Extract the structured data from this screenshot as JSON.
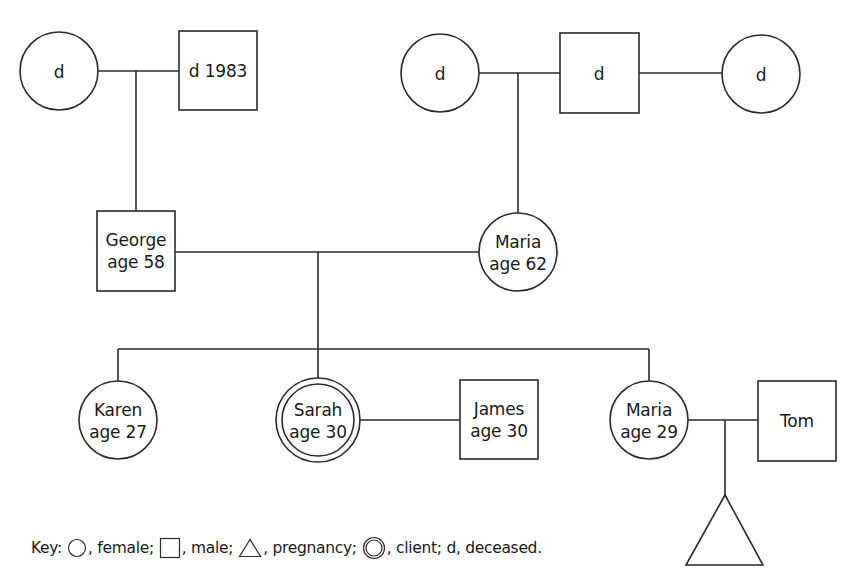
{
  "diagram": {
    "type": "genogram",
    "people": {
      "pgm": {
        "label_line1": "d",
        "label_line2": "",
        "sex": "female",
        "deceased": true
      },
      "pgf": {
        "label_line1": "d 1983",
        "label_line2": "",
        "sex": "male",
        "deceased": true
      },
      "mgm1": {
        "label_line1": "d",
        "label_line2": "",
        "sex": "female",
        "deceased": true
      },
      "mgf": {
        "label_line1": "d",
        "label_line2": "",
        "sex": "male",
        "deceased": true
      },
      "mgm2": {
        "label_line1": "d",
        "label_line2": "",
        "sex": "female",
        "deceased": true
      },
      "george": {
        "label_line1": "George",
        "label_line2": "age 58",
        "sex": "male"
      },
      "maria_mother": {
        "label_line1": "Maria",
        "label_line2": "age 62",
        "sex": "female"
      },
      "karen": {
        "label_line1": "Karen",
        "label_line2": "age 27",
        "sex": "female"
      },
      "sarah": {
        "label_line1": "Sarah",
        "label_line2": "age 30",
        "sex": "female",
        "client": true
      },
      "james": {
        "label_line1": "James",
        "label_line2": "age 30",
        "sex": "male"
      },
      "maria_sister": {
        "label_line1": "Maria",
        "label_line2": "age 29",
        "sex": "female"
      },
      "tom": {
        "label_line1": "Tom",
        "label_line2": "",
        "sex": "male"
      },
      "pregnancy": {
        "label_line1": "",
        "label_line2": "",
        "sex": "pregnancy"
      }
    },
    "relationships": [
      {
        "type": "couple",
        "a": "pgm",
        "b": "pgf",
        "children": [
          "george"
        ]
      },
      {
        "type": "couple",
        "a": "mgm1",
        "b": "mgf",
        "children": [
          "maria_mother"
        ]
      },
      {
        "type": "couple",
        "a": "mgf",
        "b": "mgm2",
        "children": []
      },
      {
        "type": "couple",
        "a": "george",
        "b": "maria_mother",
        "children": [
          "karen",
          "sarah",
          "maria_sister"
        ]
      },
      {
        "type": "couple",
        "a": "sarah",
        "b": "james",
        "children": []
      },
      {
        "type": "couple",
        "a": "maria_sister",
        "b": "tom",
        "children": [
          "pregnancy"
        ]
      }
    ]
  },
  "key": {
    "prefix": "Key:",
    "female": ", female;",
    "male": ", male;",
    "pregnancy": ", pregnancy;",
    "client": ", client; d, deceased."
  },
  "colors": {
    "stroke": "#2a2a2a",
    "background": "#ffffff",
    "text": "#1a1a1a"
  }
}
